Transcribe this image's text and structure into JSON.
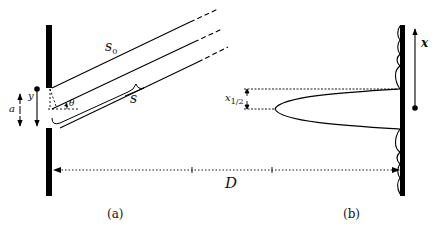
{
  "figure": {
    "panels": [
      {
        "id": "a",
        "caption": "(a)"
      },
      {
        "id": "b",
        "caption": "(b)"
      }
    ],
    "labels": {
      "s0": "s",
      "s0_sub": "0",
      "s": "s",
      "theta": "θ",
      "y": "y",
      "a": "a",
      "x_half": "x",
      "x_half_sub": "1/2",
      "x": "x",
      "D": "D"
    },
    "colors": {
      "ink": "#000000",
      "background": "#ffffff"
    }
  }
}
